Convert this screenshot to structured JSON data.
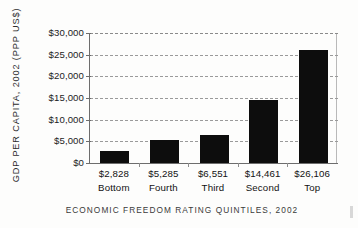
{
  "chart_data": {
    "type": "bar",
    "title": "",
    "categories": [
      "Bottom",
      "Fourth",
      "Third",
      "Second",
      "Top"
    ],
    "values": [
      2828,
      5285,
      6551,
      14461,
      26106
    ],
    "value_labels": [
      "$2,828",
      "$5,285",
      "$6,551",
      "$14,461",
      "$26,106"
    ],
    "xlabel": "ECONOMIC FREEDOM RATING QUINTILES, 2002",
    "ylabel": "GDP PER CAPITA, 2002 (PPP US$)",
    "ylim": [
      0,
      30000
    ],
    "ytick_values": [
      30000,
      25000,
      20000,
      15000,
      10000,
      5000,
      0
    ],
    "ytick_labels": [
      "$30,000",
      "$25,000",
      "$20,000",
      "$15,000",
      "$10,000",
      "$5,000",
      "$0"
    ],
    "grid": true,
    "grid_style": "dashed-horizontal",
    "legend": "none",
    "bar_color": "#0d0d0d",
    "grid_color": "#9a9a9a",
    "axis_color": "#6d6d6d"
  }
}
